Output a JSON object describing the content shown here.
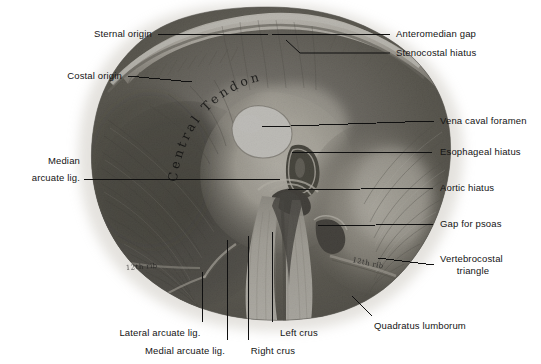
{
  "figure": {
    "rendering": "black-and-white anatomical photograph / halftone plate"
  },
  "specimen_annotations": {
    "central_tendon": "Central Tendon",
    "rib_marker_right": "12th rib",
    "rib_marker_left": "12th rib"
  },
  "labels": {
    "sternal_origin": "Sternal origin",
    "costal_origin": "Costal origin",
    "median_arcuate_line1": "Median",
    "median_arcuate_line2": "arcuate lig.",
    "anteromedian_gap": "Anteromedian gap",
    "stenocostal_hiatus": "Stenocostal hiatus",
    "vena_caval_foramen": "Vena caval foramen",
    "esophageal_hiatus": "Esophageal hiatus",
    "aortic_hiatus": "Aortic hiatus",
    "gap_for_psoas": "Gap for psoas",
    "vertebrocostal_line1": "Vertebrocostal",
    "vertebrocostal_line2": "triangle",
    "quadratus_lumborum": "Quadratus lumborum",
    "lateral_arcuate_lig": "Lateral arcuate lig.",
    "medial_arcuate_lig": "Medial arcuate lig.",
    "right_crus": "Right crus",
    "left_crus": "Left crus"
  },
  "colors": {
    "background": "#ffffff",
    "text": "#141414",
    "leader_line": "#101010",
    "specimen_dark": "#2b2b2b",
    "specimen_mid": "#6f6f6f",
    "specimen_light": "#d8d5cf",
    "foramen_white": "#fdfdfb"
  }
}
